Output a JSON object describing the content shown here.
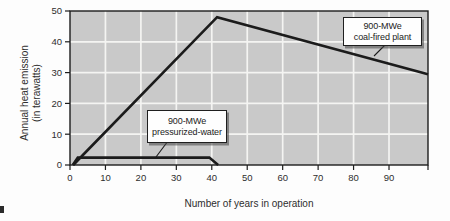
{
  "chart_data": {
    "type": "line",
    "title": "",
    "xlabel": "Number of years in operation",
    "ylabel_line1": "Annual heat emission",
    "ylabel_line2": "(in terawatts)",
    "x_ticks": [
      0,
      10,
      20,
      30,
      40,
      50,
      60,
      70,
      80,
      90
    ],
    "y_ticks": [
      0,
      10,
      20,
      30,
      40,
      50
    ],
    "x_range": [
      0,
      101
    ],
    "y_range": [
      0,
      50
    ],
    "grid": "on",
    "legend_position": "inline-callouts",
    "series": [
      {
        "name": "900-MWe coal-fired plant",
        "points": [
          [
            0.9,
            0
          ],
          [
            41.5,
            48
          ],
          [
            101,
            29.5
          ]
        ]
      },
      {
        "name": "900-MWe pressurized-water",
        "points": [
          [
            0.8,
            0
          ],
          [
            2.2,
            2.4
          ],
          [
            39.3,
            2.4
          ],
          [
            41.8,
            0
          ]
        ]
      }
    ],
    "annotations": [
      {
        "line1": "900-MWe",
        "line2": "coal-fired plant"
      },
      {
        "line1": "900-MWe",
        "line2": "pressurized-water"
      }
    ],
    "colors": {
      "plot_background": "#c9c9c9",
      "gridline": "#f4f4f2",
      "axis_border": "#1d1d1d",
      "series_line": "#1b1b1b",
      "tick_text": "#2e2e2e"
    }
  }
}
